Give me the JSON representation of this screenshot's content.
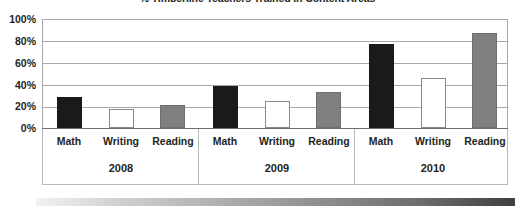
{
  "chart_data": {
    "type": "bar",
    "title": "% Timberline Teachers Trained in Content Areas",
    "xlabel": "",
    "ylabel": "",
    "ylim": [
      0,
      100
    ],
    "grid": true,
    "legend_position": "none",
    "categories": [
      "2008",
      "2009",
      "2010"
    ],
    "subcategories": [
      "Math",
      "Writing",
      "Reading"
    ],
    "series": [
      {
        "name": "Math",
        "values": [
          28,
          39,
          77
        ],
        "color": "#1a1a1a"
      },
      {
        "name": "Writing",
        "values": [
          17,
          25,
          46
        ],
        "color": "#ffffff"
      },
      {
        "name": "Reading",
        "values": [
          21,
          33,
          87
        ],
        "color": "#808080"
      }
    ],
    "bars": [
      {
        "group": "2008",
        "label": "Math",
        "value": 28,
        "style": "black"
      },
      {
        "group": "2008",
        "label": "Writing",
        "value": 17,
        "style": "white"
      },
      {
        "group": "2008",
        "label": "Reading",
        "value": 21,
        "style": "gray"
      },
      {
        "group": "2009",
        "label": "Math",
        "value": 39,
        "style": "black"
      },
      {
        "group": "2009",
        "label": "Writing",
        "value": 25,
        "style": "white"
      },
      {
        "group": "2009",
        "label": "Reading",
        "value": 33,
        "style": "gray"
      },
      {
        "group": "2010",
        "label": "Math",
        "value": 77,
        "style": "black"
      },
      {
        "group": "2010",
        "label": "Writing",
        "value": 46,
        "style": "white"
      },
      {
        "group": "2010",
        "label": "Reading",
        "value": 87,
        "style": "gray"
      }
    ],
    "yticks": [
      "100%",
      "80%",
      "60%",
      "40%",
      "20%",
      "0%"
    ],
    "ytick_values": [
      100,
      80,
      60,
      40,
      20,
      0
    ]
  },
  "axis": {
    "y_labels": [
      "100%",
      "80%",
      "60%",
      "40%",
      "20%",
      "0%"
    ],
    "group_labels": [
      "2008",
      "2009",
      "2010"
    ],
    "category_labels": [
      "Math",
      "Writing",
      "Reading"
    ]
  },
  "colors": {
    "math_bar": "#1a1a1a",
    "writing_bar": "#ffffff",
    "reading_bar": "#808080",
    "gridline": "#a7a7a7",
    "text": "#231f20"
  }
}
